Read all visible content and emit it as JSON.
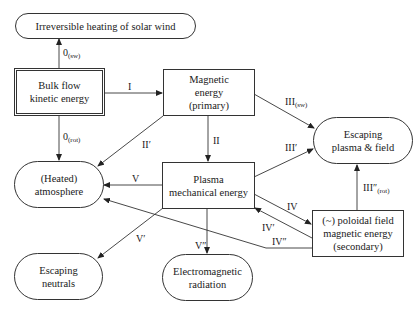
{
  "nodes": {
    "irreversible_heating": {
      "lines": [
        "Irreversible heating of solar wind"
      ]
    },
    "bulk_flow": {
      "lines": [
        "Bulk flow",
        "kinetic energy"
      ]
    },
    "magnetic_primary": {
      "lines": [
        "Magnetic",
        "energy",
        "(primary)"
      ]
    },
    "escaping_plasma": {
      "lines": [
        "Escaping",
        "plasma & field"
      ]
    },
    "heated_atmosphere": {
      "lines": [
        "(Heated)",
        "atmosphere"
      ]
    },
    "plasma_mechanical": {
      "lines": [
        "Plasma",
        "mechanical energy"
      ]
    },
    "poloidal_secondary": {
      "lines": [
        "(~) poloidal field",
        "magnetic energy",
        "(secondary)"
      ]
    },
    "escaping_neutrals": {
      "lines": [
        "Escaping",
        "neutrals"
      ]
    },
    "em_radiation": {
      "lines": [
        "Electromagnetic",
        "radiation"
      ]
    }
  },
  "edges": {
    "e0_sw": {
      "base": "0",
      "sub": "(sw)",
      "from": "Bulk flow kinetic energy",
      "to": "Irreversible heating of solar wind"
    },
    "e0_rot": {
      "base": "0",
      "sub": "(rot)",
      "from": "Bulk flow kinetic energy",
      "to": "(Heated) atmosphere"
    },
    "eI": {
      "base": "I",
      "sub": "",
      "from": "Bulk flow kinetic energy",
      "to": "Magnetic energy (primary)"
    },
    "eII": {
      "base": "II",
      "sub": "",
      "from": "Magnetic energy (primary)",
      "to": "Plasma mechanical energy"
    },
    "eII_prime": {
      "base": "II′",
      "sub": "",
      "from": "Magnetic energy (primary)",
      "to": "(Heated) atmosphere"
    },
    "eIII_sw": {
      "base": "III",
      "sub": "(sw)",
      "from": "Magnetic energy (primary)",
      "to": "Escaping plasma & field"
    },
    "eIII_prime": {
      "base": "III′",
      "sub": "",
      "from": "Plasma mechanical energy",
      "to": "Escaping plasma & field"
    },
    "eIII_dprime_rot": {
      "base": "III″",
      "sub": "(rot)",
      "from": "(~) poloidal field magnetic energy (secondary)",
      "to": "Escaping plasma & field"
    },
    "eIV": {
      "base": "IV",
      "sub": "",
      "from": "Plasma mechanical energy",
      "to": "(~) poloidal field magnetic energy (secondary)"
    },
    "eIV_prime": {
      "base": "IV′",
      "sub": "",
      "from": "(~) poloidal field magnetic energy (secondary)",
      "to": "Plasma mechanical energy"
    },
    "eIV_dprime": {
      "base": "IV″",
      "sub": "",
      "from": "(~) poloidal field magnetic energy (secondary)",
      "to": "(Heated) atmosphere"
    },
    "eV": {
      "base": "V",
      "sub": "",
      "from": "Plasma mechanical energy",
      "to": "(Heated) atmosphere"
    },
    "eV_prime": {
      "base": "V′",
      "sub": "",
      "from": "Plasma mechanical energy",
      "to": "Escaping neutrals"
    },
    "eV_dprime": {
      "base": "V″",
      "sub": "",
      "from": "Plasma mechanical energy",
      "to": "Electromagnetic radiation"
    }
  },
  "colors": {
    "stroke": "#333333",
    "text": "#1a1a1a",
    "background": "#ffffff"
  }
}
